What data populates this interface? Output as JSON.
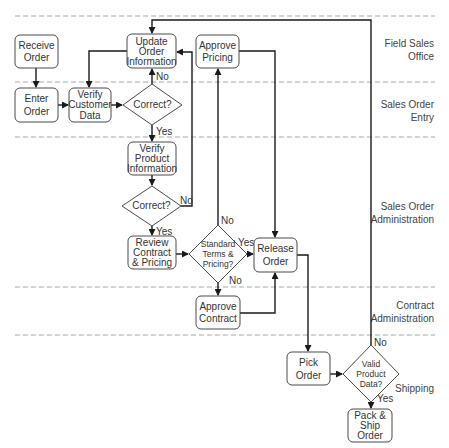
{
  "lanes": [
    {
      "line1": "Field Sales",
      "line2": "Office"
    },
    {
      "line1": "Sales Order",
      "line2": "Entry"
    },
    {
      "line1": "Sales Order",
      "line2": "Administration"
    },
    {
      "line1": "Contract",
      "line2": "Administration"
    },
    {
      "line1": "Shipping",
      "line2": ""
    }
  ],
  "nodes": {
    "receive_order": [
      "Receive",
      "Order"
    ],
    "enter_order": [
      "Enter",
      "Order"
    ],
    "verify_customer": [
      "Verify",
      "Customer",
      "Data"
    ],
    "correct1": [
      "Correct?"
    ],
    "update_order": [
      "Update",
      "Order",
      "Information"
    ],
    "approve_pricing": [
      "Approve",
      "Pricing"
    ],
    "verify_product": [
      "Verify",
      "Product",
      "Information"
    ],
    "correct2": [
      "Correct?"
    ],
    "review_contract": [
      "Review",
      "Contract",
      "& Pricing"
    ],
    "standard_terms": [
      "Standard",
      "Terms &",
      "Pricing?"
    ],
    "release_order": [
      "Release",
      "Order"
    ],
    "approve_contract": [
      "Approve",
      "Contract"
    ],
    "pick_order": [
      "Pick",
      "Order"
    ],
    "valid_product": [
      "Valid",
      "Product",
      "Data?"
    ],
    "pack_ship": [
      "Pack &",
      "Ship",
      "Order"
    ]
  },
  "edge_labels": {
    "correct1_no": "No",
    "correct1_yes": "Yes",
    "correct2_no": "No",
    "correct2_yes": "Yes",
    "standard_no_up": "No",
    "standard_yes": "Yes",
    "standard_no_down": "No",
    "valid_no": "No",
    "valid_yes": "Yes"
  }
}
